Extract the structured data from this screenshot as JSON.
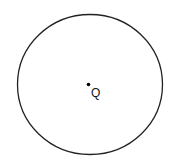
{
  "diagram": {
    "type": "geometry",
    "canvas": {
      "width": 172,
      "height": 163,
      "background": "#ffffff"
    },
    "circle": {
      "cx": 90,
      "cy": 84.5,
      "rx": 72.5,
      "ry": 70,
      "stroke": "#222222",
      "stroke_width": 1.3
    },
    "point": {
      "name": "Q",
      "x": 88.5,
      "y": 84.5,
      "radius": 1.8,
      "color": "#000000",
      "label": "Q",
      "label_x": 91,
      "label_y": 97
    }
  }
}
